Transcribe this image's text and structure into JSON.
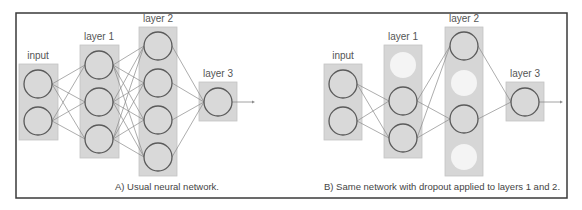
{
  "colors": {
    "frame": "#3a3a3a",
    "layer_box_fill": "#d6d6d6",
    "layer_box_stroke": "#c4c4c4",
    "node_fill": "#d9d9d9",
    "node_stroke": "#5a5a5a",
    "dropped_node_fill": "#f4f4f4",
    "edge": "#8a8a8a",
    "label": "#555555",
    "caption": "#444444"
  },
  "panels": [
    {
      "id": "A",
      "caption": "A) Usual neural network.",
      "caption_pos": [
        167,
        190
      ],
      "layers": [
        {
          "label": "input",
          "label_pos": [
            38,
            59
          ],
          "box": [
            19,
            64,
            39,
            76
          ],
          "nodes": [
            {
              "cx": 38,
              "cy": 84,
              "dropped": false
            },
            {
              "cx": 38,
              "cy": 121,
              "dropped": false
            }
          ]
        },
        {
          "label": "layer 1",
          "label_pos": [
            99,
            40
          ],
          "box": [
            80,
            45,
            39,
            113
          ],
          "nodes": [
            {
              "cx": 99,
              "cy": 65,
              "dropped": false
            },
            {
              "cx": 99,
              "cy": 102,
              "dropped": false
            },
            {
              "cx": 99,
              "cy": 139,
              "dropped": false
            }
          ]
        },
        {
          "label": "layer 2",
          "label_pos": [
            158,
            22
          ],
          "box": [
            139,
            27,
            38,
            149
          ],
          "nodes": [
            {
              "cx": 158,
              "cy": 46,
              "dropped": false
            },
            {
              "cx": 158,
              "cy": 83,
              "dropped": false
            },
            {
              "cx": 158,
              "cy": 120,
              "dropped": false
            },
            {
              "cx": 158,
              "cy": 157,
              "dropped": false
            }
          ]
        },
        {
          "label": "layer 3",
          "label_pos": [
            218,
            77
          ],
          "box": [
            199,
            82,
            38,
            39
          ],
          "nodes": [
            {
              "cx": 218,
              "cy": 102,
              "dropped": false
            }
          ]
        }
      ],
      "output_arrow": {
        "x1": 232,
        "y1": 102,
        "x2": 255,
        "y2": 102
      }
    },
    {
      "id": "B",
      "caption": "B) Same network with dropout applied to layers 1 and 2.",
      "caption_pos": [
        442,
        190
      ],
      "layers": [
        {
          "label": "input",
          "label_pos": [
            343,
            59
          ],
          "box": [
            324,
            64,
            38,
            76
          ],
          "nodes": [
            {
              "cx": 343,
              "cy": 84,
              "dropped": false
            },
            {
              "cx": 343,
              "cy": 121,
              "dropped": false
            }
          ]
        },
        {
          "label": "layer 1",
          "label_pos": [
            403,
            40
          ],
          "box": [
            384,
            45,
            38,
            113
          ],
          "nodes": [
            {
              "cx": 403,
              "cy": 65,
              "dropped": true
            },
            {
              "cx": 403,
              "cy": 101,
              "dropped": false
            },
            {
              "cx": 403,
              "cy": 138,
              "dropped": false
            }
          ]
        },
        {
          "label": "layer 2",
          "label_pos": [
            464,
            22
          ],
          "box": [
            445,
            27,
            38,
            149
          ],
          "nodes": [
            {
              "cx": 464,
              "cy": 46,
              "dropped": false
            },
            {
              "cx": 464,
              "cy": 83,
              "dropped": true
            },
            {
              "cx": 464,
              "cy": 119,
              "dropped": false
            },
            {
              "cx": 464,
              "cy": 157,
              "dropped": true
            }
          ]
        },
        {
          "label": "layer 3",
          "label_pos": [
            525,
            77
          ],
          "box": [
            506,
            82,
            38,
            39
          ],
          "nodes": [
            {
              "cx": 525,
              "cy": 102,
              "dropped": false
            }
          ]
        }
      ],
      "output_arrow": {
        "x1": 539,
        "y1": 102,
        "x2": 563,
        "y2": 102
      }
    }
  ],
  "frame": {
    "x": 16,
    "y": 13,
    "w": 551,
    "h": 185
  },
  "node_radius": 14
}
